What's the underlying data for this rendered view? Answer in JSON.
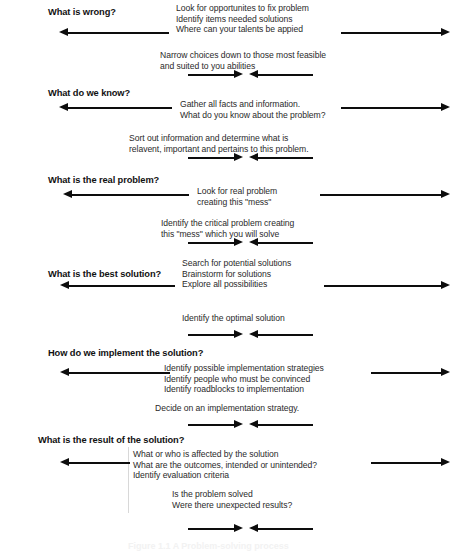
{
  "figure": {
    "caption": "Figure 1.1 A Problem-solving process",
    "sections": [
      {
        "id": "what-is-wrong",
        "heading": "What is wrong?",
        "primary_lines": [
          "Look for opportunites to fix problem",
          "Identify items needed solutions",
          "Where can your talents be appied"
        ],
        "secondary_lines": [
          "Narrow choices down to those most feasible",
          "and suited to you abilities"
        ]
      },
      {
        "id": "what-do-we-know",
        "heading": "What do we know?",
        "primary_lines": [
          "Gather all facts and information.",
          "What do you know about the problem?"
        ],
        "secondary_lines": [
          "Sort out information and determine what is",
          "relavent, important and pertains to this problem."
        ]
      },
      {
        "id": "what-is-the-real-problem",
        "heading": "What is the real problem?",
        "primary_lines": [
          "Look for real problem",
          "creating this \"mess\""
        ],
        "secondary_lines": [
          "Identify the critical problem creating",
          "this \"mess\" which you will solve"
        ]
      },
      {
        "id": "what-is-the-best-solution",
        "heading": "What is the best solution?",
        "primary_lines": [
          "Search for potential solutions",
          "Brainstorm for solutions",
          "Explore all possibilities"
        ],
        "secondary_lines": [
          "Identify the optimal solution"
        ]
      },
      {
        "id": "how-do-we-implement-the-solution",
        "heading": "How do we implement the solution?",
        "primary_lines": [
          "Identify possible implementation strategies",
          "Identify people who must be convinced",
          "Identify roadblocks to implementation"
        ],
        "secondary_lines": [
          "Decide on an implementation strategy."
        ]
      },
      {
        "id": "what-is-the-result-of-the-solution",
        "heading": "What is the result of the solution?",
        "primary_lines": [
          "What or who is affected by the solution",
          "What are the outcomes, intended or unintended?",
          "Identify evaluation criteria"
        ],
        "secondary_lines": [
          "Is the problem solved",
          "Were there unexpected results?"
        ]
      }
    ]
  },
  "colors": {
    "arrow": "#0d0d0d",
    "heading_text": "#111111",
    "body_text": "#2a2a2a",
    "background": "#ffffff"
  }
}
